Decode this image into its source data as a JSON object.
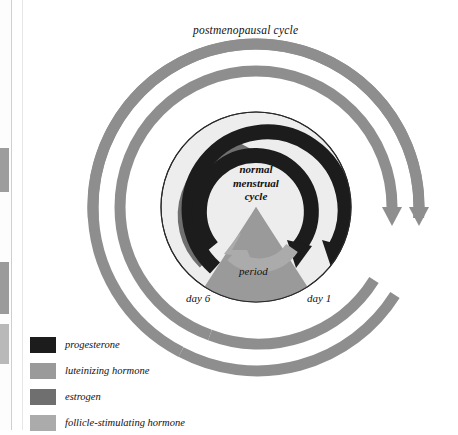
{
  "figure": {
    "outer_label": "postmenopausal cycle",
    "center_label_lines": [
      "normal",
      "menstrual",
      "cycle"
    ],
    "period_label": "period",
    "day_start_label": "day 1",
    "day_mid_label": "day 6"
  },
  "legend": {
    "items": [
      {
        "label": "progesterone",
        "color": "#1c1c1c"
      },
      {
        "label": "luteinizing hormone",
        "color": "#9a9a9a"
      },
      {
        "label": "estrogen",
        "color": "#6f6f6f"
      },
      {
        "label": "follicle-stimulating hormone",
        "color": "#ababab"
      }
    ]
  },
  "colors": {
    "outer_ring": "#8e8e8e",
    "inner_disc": "#ededed",
    "disc_outline": "#2a2a2a",
    "progesterone": "#1c1c1c",
    "luteinizing": "#9a9a9a",
    "estrogen": "#6f6f6f",
    "fsh": "#ababab",
    "period_wedge": "#9a9a9a",
    "background": "#ffffff"
  }
}
